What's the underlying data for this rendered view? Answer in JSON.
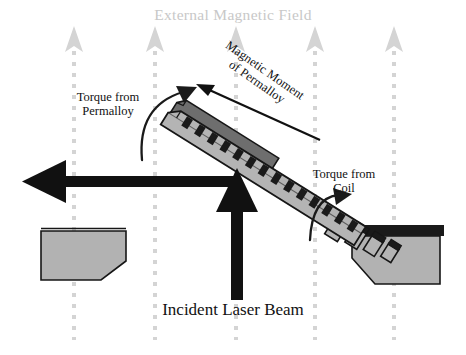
{
  "figure": {
    "width": 466,
    "height": 355,
    "background": "#ffffff",
    "title": "External Magnetic Field"
  },
  "labels": {
    "title": "External Magnetic Field",
    "torque_permalloy_line1": "Torque from",
    "torque_permalloy_line2": "Permalloy",
    "torque_coil_line1": "Torque from",
    "torque_coil_line2": "Coil",
    "magnetic_moment_line1": "Magnetic Moment",
    "magnetic_moment_line2": "of Permalloy",
    "incident_laser": "Incident Laser Beam"
  },
  "colors": {
    "field_gray": "#d2d2d2",
    "title_gray": "#c8c8c8",
    "support_fill": "#b2b2b2",
    "beam_fill": "#b4b4b4",
    "permalloy_fill": "#6e6e6e",
    "coil_black": "#1a1a1a",
    "outline": "#161616",
    "arrow_black": "#111111",
    "background": "#ffffff"
  },
  "field_arrows": {
    "count": 5,
    "x_positions": [
      74,
      155,
      236,
      315,
      394
    ],
    "tip_y": 28,
    "line_bottom_y": 340,
    "dash_color": "#d2d2d2",
    "head_color": "#d2d2d2"
  },
  "beam": {
    "description": "diagonal cantilever with permalloy slab and coil windings",
    "tip_x": 166,
    "tip_y": 116,
    "base_x": 352,
    "base_y": 232,
    "coil_segment_count": 14,
    "detached_segment_count": 4
  },
  "supports": {
    "left": {
      "x": 40,
      "y": 228,
      "width": 86,
      "height": 52
    },
    "right": {
      "x": 348,
      "y": 228,
      "width": 92,
      "height": 52
    },
    "right_cap_color": "#1a1a1a"
  },
  "laser": {
    "incident_arrow": {
      "x": 237,
      "from_y": 300,
      "to_y": 182,
      "direction": "up"
    },
    "reflected_arrow": {
      "y": 181,
      "from_x": 237,
      "to_x": 24,
      "direction": "left"
    },
    "stroke_width": 11
  }
}
